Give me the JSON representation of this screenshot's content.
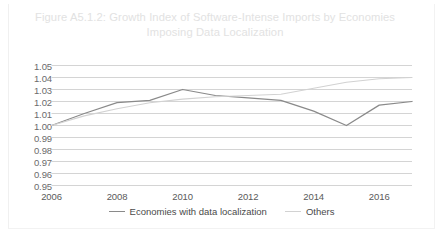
{
  "figure": {
    "title": "Figure A5.1.2: Growth Index of Software-Intense Imports by Economies Imposing Data Localization",
    "title_color": "#e2e2e2",
    "background": "#ffffff"
  },
  "legend": {
    "position": "bottom-center",
    "items": [
      {
        "label": "Economies with data localization",
        "color": "#8a8a8a"
      },
      {
        "label": "Others",
        "color": "#d2d2d2"
      }
    ]
  },
  "chart_data": {
    "type": "line",
    "title": "Figure A5.1.2: Growth Index of Software-Intense Imports by Economies Imposing Data Localization",
    "xlabel": "",
    "ylabel": "",
    "x": [
      2006,
      2007,
      2008,
      2009,
      2010,
      2011,
      2012,
      2013,
      2014,
      2015,
      2016,
      2017
    ],
    "xlim": [
      2006,
      2017
    ],
    "xticks": [
      2006,
      2008,
      2010,
      2012,
      2014,
      2016
    ],
    "xticklabels": [
      "2006",
      "2008",
      "2010",
      "2012",
      "2014",
      "2016"
    ],
    "ylim": [
      0.95,
      1.05
    ],
    "yticks": [
      0.95,
      0.96,
      0.97,
      0.98,
      0.99,
      1.0,
      1.01,
      1.02,
      1.03,
      1.04,
      1.05
    ],
    "yticklabels": [
      "0.95",
      "0.96",
      "0.97",
      "0.98",
      "0.99",
      "1.00",
      "1.01",
      "1.02",
      "1.03",
      "1.04",
      "1.05"
    ],
    "grid": true,
    "grid_axis": "y",
    "grid_color": "#c9c9c9",
    "legend_position": "bottom",
    "series": [
      {
        "name": "Economies with data localization",
        "color": "#8a8a8a",
        "values": [
          1.0,
          1.01,
          1.019,
          1.021,
          1.03,
          1.025,
          1.023,
          1.021,
          1.012,
          1.0,
          1.017,
          1.02
        ]
      },
      {
        "name": "Others",
        "color": "#d2d2d2",
        "values": [
          1.0,
          1.008,
          1.014,
          1.019,
          1.022,
          1.024,
          1.025,
          1.026,
          1.031,
          1.036,
          1.039,
          1.04
        ]
      }
    ]
  }
}
